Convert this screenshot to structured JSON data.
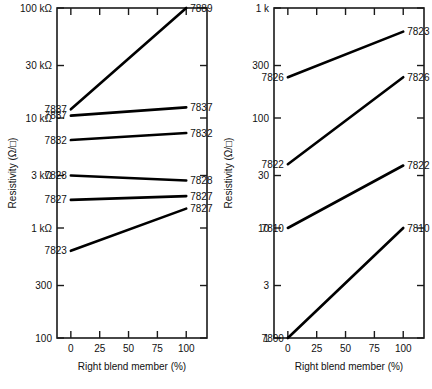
{
  "figure": {
    "panel_count": 2,
    "background_color": "#ffffff",
    "line_color": "#000000",
    "axis_color": "#1a1a1a"
  },
  "panels": [
    {
      "id": "left",
      "ylabel": "Resistivity (Ω/□)",
      "xlabel": "Right blend member (%)",
      "ytick_labels": [
        "100 kΩ",
        "30 kΩ",
        "10 kΩ",
        "3 kΩ",
        "1 kΩ",
        "300",
        "100"
      ],
      "ytick_values": [
        100000,
        30000,
        10000,
        3000,
        1000,
        300,
        100
      ],
      "xtick_labels": [
        "0",
        "25",
        "50",
        "75",
        "100"
      ],
      "xtick_values": [
        0,
        25,
        50,
        75,
        100
      ]
    },
    {
      "id": "right",
      "ylabel": "Resistivity (Ω/□)",
      "xlabel": "Right blend member (%)",
      "ytick_labels": [
        "1 k",
        "300",
        "100",
        "30",
        "10",
        "3",
        "1"
      ],
      "ytick_values": [
        1000,
        300,
        100,
        30,
        10,
        3,
        1
      ],
      "xtick_labels": [
        "0",
        "25",
        "50",
        "75",
        "100"
      ],
      "xtick_values": [
        0,
        25,
        50,
        75,
        100
      ]
    }
  ],
  "chart_data": [
    {
      "type": "line",
      "panel": "left",
      "title": "",
      "xlabel": "Right blend member (%)",
      "ylabel": "Resistivity (Ω/□)",
      "yscale": "log",
      "xscale": "linear",
      "xlim": [
        -12,
        118
      ],
      "ylim": [
        100,
        100000
      ],
      "xticks": [
        0,
        25,
        50,
        75,
        100
      ],
      "xticklabels": [
        "0",
        "25",
        "50",
        "75",
        "100"
      ],
      "yticks": [
        100000,
        30000,
        10000,
        3000,
        1000,
        300,
        100
      ],
      "yticklabels": [
        "100 kΩ",
        "30 kΩ",
        "10 kΩ",
        "3 kΩ",
        "1 kΩ",
        "300",
        "100"
      ],
      "grid": false,
      "legend": "endpoint-labels",
      "x": [
        0,
        100
      ],
      "series": [
        {
          "name": "7889",
          "values": [
            12000,
            100000
          ],
          "label_left": "7837",
          "label_right": "7889"
        },
        {
          "name": "7837",
          "values": [
            10500,
            12500
          ],
          "label_left": "7837",
          "label_right": "7837"
        },
        {
          "name": "7832",
          "values": [
            6300,
            7300
          ],
          "label_left": "7832",
          "label_right": "7832"
        },
        {
          "name": "7828",
          "values": [
            3000,
            2700
          ],
          "label_left": "7828",
          "label_right": "7828"
        },
        {
          "name": "7827",
          "values": [
            1800,
            1950
          ],
          "label_left": "7827",
          "label_right": "7827"
        },
        {
          "name": "7823",
          "values": [
            620,
            1500
          ],
          "label_left": "7823",
          "label_right": "7827"
        }
      ]
    },
    {
      "type": "line",
      "panel": "right",
      "title": "",
      "xlabel": "Right blend member (%)",
      "ylabel": "Resistivity (Ω/□)",
      "yscale": "log",
      "xscale": "linear",
      "xlim": [
        -12,
        118
      ],
      "ylim": [
        1,
        1000
      ],
      "xticks": [
        0,
        25,
        50,
        75,
        100
      ],
      "xticklabels": [
        "0",
        "25",
        "50",
        "75",
        "100"
      ],
      "yticks": [
        1000,
        300,
        100,
        30,
        10,
        3,
        1
      ],
      "yticklabels": [
        "1 k",
        "300",
        "100",
        "30",
        "10",
        "3",
        "1"
      ],
      "grid": false,
      "legend": "endpoint-labels",
      "x": [
        0,
        100
      ],
      "series": [
        {
          "name": "7823",
          "values": [
            235,
            610
          ],
          "label_left": "7826",
          "label_right": "7823"
        },
        {
          "name": "7826",
          "values": [
            38,
            235
          ],
          "label_left": "7822",
          "label_right": "7826"
        },
        {
          "name": "7822",
          "values": [
            10,
            37
          ],
          "label_left": "7810",
          "label_right": "7822"
        },
        {
          "name": "7810",
          "values": [
            1,
            10
          ],
          "label_left": "7800",
          "label_right": "7810"
        }
      ]
    }
  ]
}
